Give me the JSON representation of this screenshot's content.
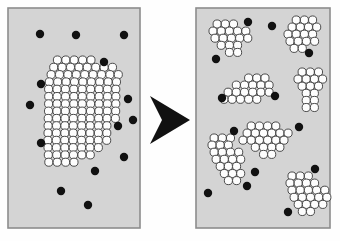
{
  "figure": {
    "canvas": {
      "width": 340,
      "height": 241
    },
    "colors": {
      "page_background": "#fefefe",
      "panel_fill": "#d4d4d4",
      "panel_border": "#8c8c8c",
      "white_particle_fill": "#fdfdfd",
      "white_particle_stroke": "#3a3a3a",
      "black_particle_fill": "#111111",
      "arrow_fill": "#111111"
    },
    "geometry": {
      "white_particle_radius": 4.05,
      "white_particle_stroke_width": 0.9,
      "black_particle_radius": 4.2,
      "panel_border_width": 1.6
    }
  },
  "panels": [
    {
      "id": "panel-before",
      "label": "before",
      "x": 8,
      "y": 8,
      "width": 132,
      "height": 220,
      "aggregate_count": 1,
      "white_particle_count": 112,
      "black_particle_count": 14,
      "clusters": [
        {
          "id": "cluster-large",
          "name": "large-aggregate",
          "origin": [
            52.0,
            60.0
          ],
          "pitch": 8.4,
          "row_shear": -0.9,
          "rows": [
            {
              "dy": 0.0,
              "dx": 5.4,
              "n": 5
            },
            {
              "dy": 7.3,
              "dx": 2.6,
              "n": 8
            },
            {
              "dy": 14.6,
              "dx": 0.9,
              "n": 9
            },
            {
              "dy": 21.9,
              "dx": 0.0,
              "n": 9
            },
            {
              "dy": 29.2,
              "dx": 0.2,
              "n": 9
            },
            {
              "dy": 36.5,
              "dx": 1.2,
              "n": 9
            },
            {
              "dy": 43.8,
              "dx": 2.0,
              "n": 9
            },
            {
              "dy": 51.1,
              "dx": 2.8,
              "n": 9
            },
            {
              "dy": 58.4,
              "dx": 3.4,
              "n": 9
            },
            {
              "dy": 65.7,
              "dx": 4.2,
              "n": 8
            },
            {
              "dy": 73.0,
              "dx": 5.0,
              "n": 8
            },
            {
              "dy": 80.3,
              "dx": 5.8,
              "n": 8
            },
            {
              "dy": 87.6,
              "dx": 6.8,
              "n": 7
            },
            {
              "dy": 94.9,
              "dx": 8.0,
              "n": 6
            },
            {
              "dy": 102.2,
              "dx": 9.4,
              "n": 4
            }
          ]
        }
      ],
      "black_particles": [
        [
          40,
          34
        ],
        [
          76,
          35
        ],
        [
          124,
          35
        ],
        [
          104,
          62
        ],
        [
          41,
          84
        ],
        [
          30,
          105
        ],
        [
          128,
          99
        ],
        [
          118,
          126
        ],
        [
          41,
          143
        ],
        [
          124,
          157
        ],
        [
          95,
          171
        ],
        [
          61,
          191
        ],
        [
          88,
          205
        ],
        [
          133,
          120
        ]
      ]
    },
    {
      "id": "panel-after",
      "label": "after",
      "x": 196,
      "y": 8,
      "width": 134,
      "height": 220,
      "aggregate_count": 7,
      "white_particle_count": 96,
      "black_particle_count": 13,
      "clusters": [
        {
          "id": "cluster-top-left",
          "name": "fragment-top-left",
          "origin": [
            213.0,
            24.0
          ],
          "pitch": 8.2,
          "row_shear": 0.0,
          "rows": [
            {
              "dy": 0.0,
              "dx": 4.1,
              "n": 3
            },
            {
              "dy": 7.1,
              "dx": 0.0,
              "n": 5
            },
            {
              "dy": 14.2,
              "dx": 2.0,
              "n": 5
            },
            {
              "dy": 21.3,
              "dx": 8.2,
              "n": 3
            },
            {
              "dy": 28.4,
              "dx": 16.4,
              "n": 2
            }
          ]
        },
        {
          "id": "cluster-top-right",
          "name": "fragment-top-right",
          "origin": [
            288.0,
            20.0
          ],
          "pitch": 8.2,
          "row_shear": 0.0,
          "rows": [
            {
              "dy": 0.0,
              "dx": 8.2,
              "n": 3
            },
            {
              "dy": 7.1,
              "dx": 4.1,
              "n": 4
            },
            {
              "dy": 14.2,
              "dx": 0.0,
              "n": 4
            },
            {
              "dy": 21.3,
              "dx": 2.0,
              "n": 4
            },
            {
              "dy": 28.4,
              "dx": 6.1,
              "n": 2
            }
          ]
        },
        {
          "id": "cluster-mid-left",
          "name": "fragment-mid-left",
          "origin": [
            224.0,
            78.0
          ],
          "pitch": 8.2,
          "row_shear": 0.0,
          "rows": [
            {
              "dy": 0.0,
              "dx": 24.6,
              "n": 3
            },
            {
              "dy": 7.1,
              "dx": 12.3,
              "n": 5
            },
            {
              "dy": 14.2,
              "dx": 4.1,
              "n": 6
            },
            {
              "dy": 21.3,
              "dx": 0.0,
              "n": 5
            }
          ]
        },
        {
          "id": "cluster-mid-right",
          "name": "fragment-mid-right",
          "origin": [
            298.0,
            72.0
          ],
          "pitch": 8.2,
          "row_shear": 0.0,
          "rows": [
            {
              "dy": 0.0,
              "dx": 4.1,
              "n": 3
            },
            {
              "dy": 7.1,
              "dx": 0.0,
              "n": 4
            },
            {
              "dy": 14.2,
              "dx": 4.1,
              "n": 3
            },
            {
              "dy": 21.3,
              "dx": 8.2,
              "n": 2
            },
            {
              "dy": 28.4,
              "dx": 8.2,
              "n": 2
            },
            {
              "dy": 35.5,
              "dx": 8.2,
              "n": 2
            }
          ]
        },
        {
          "id": "cluster-center",
          "name": "fragment-center",
          "origin": [
            243.0,
            126.0
          ],
          "pitch": 8.2,
          "row_shear": 0.0,
          "rows": [
            {
              "dy": 0.0,
              "dx": 8.2,
              "n": 4
            },
            {
              "dy": 7.1,
              "dx": 4.1,
              "n": 6
            },
            {
              "dy": 14.2,
              "dx": 0.0,
              "n": 6
            },
            {
              "dy": 21.3,
              "dx": 12.3,
              "n": 4
            },
            {
              "dy": 28.4,
              "dx": 20.5,
              "n": 2
            }
          ]
        },
        {
          "id": "cluster-bottom-left",
          "name": "fragment-bottom-left",
          "origin": [
            210.0,
            138.0
          ],
          "pitch": 8.2,
          "row_shear": 0.0,
          "rows": [
            {
              "dy": 0.0,
              "dx": 4.1,
              "n": 3
            },
            {
              "dy": 7.1,
              "dx": 2.0,
              "n": 3
            },
            {
              "dy": 14.2,
              "dx": 4.1,
              "n": 4
            },
            {
              "dy": 21.3,
              "dx": 6.1,
              "n": 4
            },
            {
              "dy": 28.4,
              "dx": 10.2,
              "n": 3
            },
            {
              "dy": 35.5,
              "dx": 14.3,
              "n": 3
            },
            {
              "dy": 42.6,
              "dx": 18.4,
              "n": 2
            }
          ]
        },
        {
          "id": "cluster-bottom-right",
          "name": "fragment-bottom-right",
          "origin": [
            290.0,
            176.0
          ],
          "pitch": 8.2,
          "row_shear": 0.0,
          "rows": [
            {
              "dy": 0.0,
              "dx": 2.0,
              "n": 3
            },
            {
              "dy": 7.1,
              "dx": 0.0,
              "n": 4
            },
            {
              "dy": 14.2,
              "dx": 2.0,
              "n": 5
            },
            {
              "dy": 21.3,
              "dx": 4.1,
              "n": 5
            },
            {
              "dy": 28.4,
              "dx": 8.2,
              "n": 4
            },
            {
              "dy": 35.5,
              "dx": 12.3,
              "n": 2
            }
          ]
        }
      ],
      "black_particles": [
        [
          248,
          22
        ],
        [
          272,
          26
        ],
        [
          309,
          53
        ],
        [
          216,
          59
        ],
        [
          275,
          96
        ],
        [
          222,
          98
        ],
        [
          299,
          127
        ],
        [
          234,
          131
        ],
        [
          315,
          169
        ],
        [
          255,
          172
        ],
        [
          247,
          186
        ],
        [
          288,
          212
        ],
        [
          208,
          193
        ]
      ]
    }
  ],
  "arrow": {
    "id": "transition-arrow",
    "name": "rightward-arrow",
    "direction": "right",
    "points": "150,96 190,120 150,144 162,120",
    "fill": "#111111"
  }
}
